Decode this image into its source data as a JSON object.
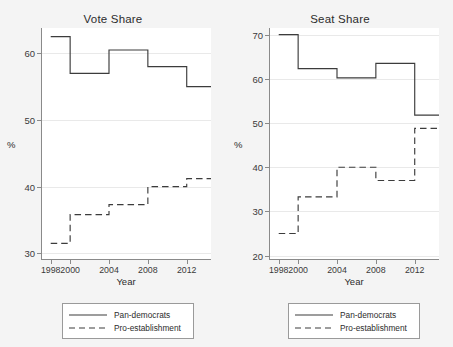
{
  "figure": {
    "background_color": "#f4f4f4",
    "plot_background_color": "#ffffff",
    "line_color": "#3c3c3c",
    "axis_color": "#8a8a8a",
    "grid_color": "#e9e9e9"
  },
  "chart_data": [
    {
      "type": "line",
      "title": "Vote Share",
      "xlabel": "Year",
      "ylabel": "%",
      "drawstyle": "steps-post",
      "grid": true,
      "legend_position": "below",
      "xlim": [
        1997.0,
        2014.5
      ],
      "ylim": [
        29.0,
        63.8
      ],
      "xticks": [
        1998,
        2000,
        2004,
        2008,
        2012
      ],
      "xtick_labels": [
        "1998",
        "2000",
        "2004",
        "2008",
        "2012"
      ],
      "yticks": [
        30,
        40,
        50,
        60
      ],
      "ytick_labels": [
        "30",
        "40",
        "50",
        "60"
      ],
      "x": [
        1998,
        2000,
        2004,
        2008,
        2012,
        2014.5
      ],
      "series": [
        {
          "name": "Pan-democrats",
          "style": "solid",
          "values": [
            62.5,
            57.0,
            60.5,
            58.0,
            55.0,
            55.0
          ]
        },
        {
          "name": "Pro-establishment",
          "style": "dashed",
          "values": [
            31.5,
            35.8,
            37.3,
            40.0,
            41.2,
            41.2
          ]
        }
      ]
    },
    {
      "type": "line",
      "title": "Seat Share",
      "xlabel": "Year",
      "ylabel": "%",
      "drawstyle": "steps-post",
      "grid": true,
      "legend_position": "below",
      "xlim": [
        1997.0,
        2014.5
      ],
      "ylim": [
        19.0,
        71.5
      ],
      "xticks": [
        1998,
        2000,
        2004,
        2008,
        2012
      ],
      "xtick_labels": [
        "1998",
        "2000",
        "2004",
        "2008",
        "2012"
      ],
      "yticks": [
        20,
        30,
        40,
        50,
        60,
        70
      ],
      "ytick_labels": [
        "20",
        "30",
        "40",
        "50",
        "60",
        "70"
      ],
      "x": [
        1998,
        2000,
        2004,
        2008,
        2012,
        2014.5
      ],
      "series": [
        {
          "name": "Pan-democrats",
          "style": "solid",
          "values": [
            70.0,
            62.3,
            60.2,
            63.5,
            51.8,
            51.8
          ]
        },
        {
          "name": "Pro-establishment",
          "style": "dashed",
          "values": [
            25.0,
            33.3,
            40.0,
            37.0,
            48.8,
            48.8
          ]
        }
      ]
    }
  ],
  "panels": [
    {
      "id": "vote-share",
      "title": "Vote Share",
      "axis_title_x": "Year",
      "axis_title_y": "%",
      "legend": [
        {
          "label": "Pan-democrats",
          "style": "solid"
        },
        {
          "label": "Pro-establishment",
          "style": "dashed"
        }
      ]
    },
    {
      "id": "seat-share",
      "title": "Seat Share",
      "axis_title_x": "Year",
      "axis_title_y": "%",
      "legend": [
        {
          "label": "Pan-democrats",
          "style": "solid"
        },
        {
          "label": "Pro-establishment",
          "style": "dashed"
        }
      ]
    }
  ]
}
